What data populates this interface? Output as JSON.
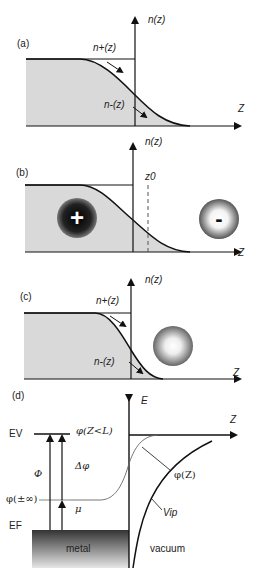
{
  "panels": {
    "a": {
      "label": "(a)",
      "y_axis": "n(z)",
      "x_axis": "Z",
      "n_plus": "n+(z)",
      "n_minus": "n-(z)"
    },
    "b": {
      "label": "(b)",
      "y_axis": "n(z)",
      "x_axis": "Z",
      "z0": "z0",
      "positive_charge": "+",
      "negative_charge": "-"
    },
    "c": {
      "label": "(c)",
      "y_axis": "n(z)",
      "x_axis": "Z",
      "n_plus": "n+(z)",
      "n_minus": "n-(z)"
    },
    "d": {
      "label": "(d)",
      "y_axis": "E",
      "x_axis": "Z",
      "ev": "EV",
      "ef": "EF",
      "phi_zl": "φ(Z<L)",
      "delta_phi": "Δφ",
      "work_function": "Φ",
      "phi_inf": "φ(±∞)",
      "mu": "μ",
      "phi_z": "φ(Z)",
      "v_ip": "Vip",
      "metal": "metal",
      "vacuum": "vacuum"
    }
  },
  "colors": {
    "fill_gray": "#d9d9d9",
    "line": "#111111",
    "metal_dark": "#3a3a3a",
    "metal_light": "#e0e0e0"
  }
}
